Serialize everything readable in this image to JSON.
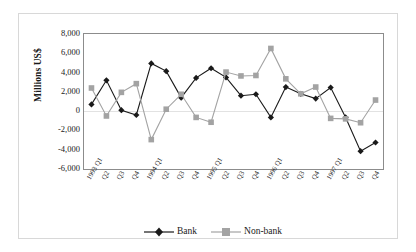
{
  "chart_data": {
    "type": "line",
    "title": "",
    "xlabel": "",
    "ylabel": "Millions US$",
    "ylim": [
      -6000,
      8000
    ],
    "ytick_step": 2000,
    "yticks": [
      "8,000",
      "6,000",
      "4,000",
      "2,000",
      "0",
      "-2,000",
      "-4,000",
      "-6,000"
    ],
    "ytick_values": [
      8000,
      6000,
      4000,
      2000,
      0,
      -2000,
      -4000,
      -6000
    ],
    "grid": false,
    "zero_line": true,
    "legend_position": "bottom",
    "categories": [
      "1993 Q1",
      "Q2",
      "Q3",
      "Q4",
      "1994 Q1",
      "Q2",
      "Q3",
      "Q4",
      "1995 Q1",
      "Q2",
      "Q3",
      "Q4",
      "1996 Q1",
      "Q2",
      "Q3",
      "Q4",
      "1997 Q1",
      "Q2",
      "Q3",
      "Q4"
    ],
    "series": [
      {
        "name": "Bank",
        "color": "#1a1a1a",
        "marker": "diamond",
        "values": [
          700,
          3200,
          100,
          -400,
          4950,
          4150,
          1400,
          3450,
          4450,
          3500,
          1600,
          1750,
          -650,
          2500,
          1800,
          1300,
          2450,
          -650,
          -4150,
          -3250
        ]
      },
      {
        "name": "Non-bank",
        "color": "#a3a3a3",
        "marker": "square",
        "values": [
          2400,
          -500,
          1950,
          2850,
          -2950,
          200,
          1750,
          -650,
          -1150,
          4050,
          3650,
          3700,
          6500,
          3350,
          1800,
          2500,
          -750,
          -800,
          -1200,
          1150
        ]
      }
    ]
  },
  "legend": {
    "items": [
      {
        "label": "Bank"
      },
      {
        "label": "Non-bank"
      }
    ]
  }
}
